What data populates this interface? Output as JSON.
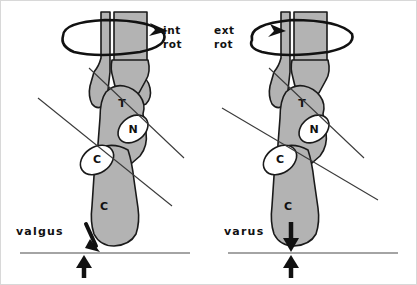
{
  "figure": {
    "background_color": "#ffffff",
    "bone_fill_color": "#b3b3b3",
    "bone_outline_color": "#1a1a1a",
    "axis_line_color": "#3a3a3a",
    "arrow_color": "#111111",
    "frame_border_color": "#d8d8d8"
  },
  "panels": [
    {
      "id": "left",
      "rotation_label_line1": "int",
      "rotation_label_line2": "rot",
      "rotation_direction": "internal",
      "deformity_label": "valgus",
      "load_arrow_down": "downward force arrow",
      "load_arrow_up": "ground reaction arrow",
      "bones": [
        {
          "key": "talus",
          "letter": "T"
        },
        {
          "key": "navicular",
          "letter": "N"
        },
        {
          "key": "cuboid",
          "letter": "C"
        },
        {
          "key": "calcaneus",
          "letter": "C"
        }
      ]
    },
    {
      "id": "right",
      "rotation_label_line1": "ext",
      "rotation_label_line2": "rot",
      "rotation_direction": "external",
      "deformity_label": "varus",
      "load_arrow_down": "downward force arrow",
      "load_arrow_up": "ground reaction arrow",
      "bones": [
        {
          "key": "talus",
          "letter": "T"
        },
        {
          "key": "navicular",
          "letter": "N"
        },
        {
          "key": "cuboid",
          "letter": "C"
        },
        {
          "key": "calcaneus",
          "letter": "C"
        }
      ]
    }
  ]
}
